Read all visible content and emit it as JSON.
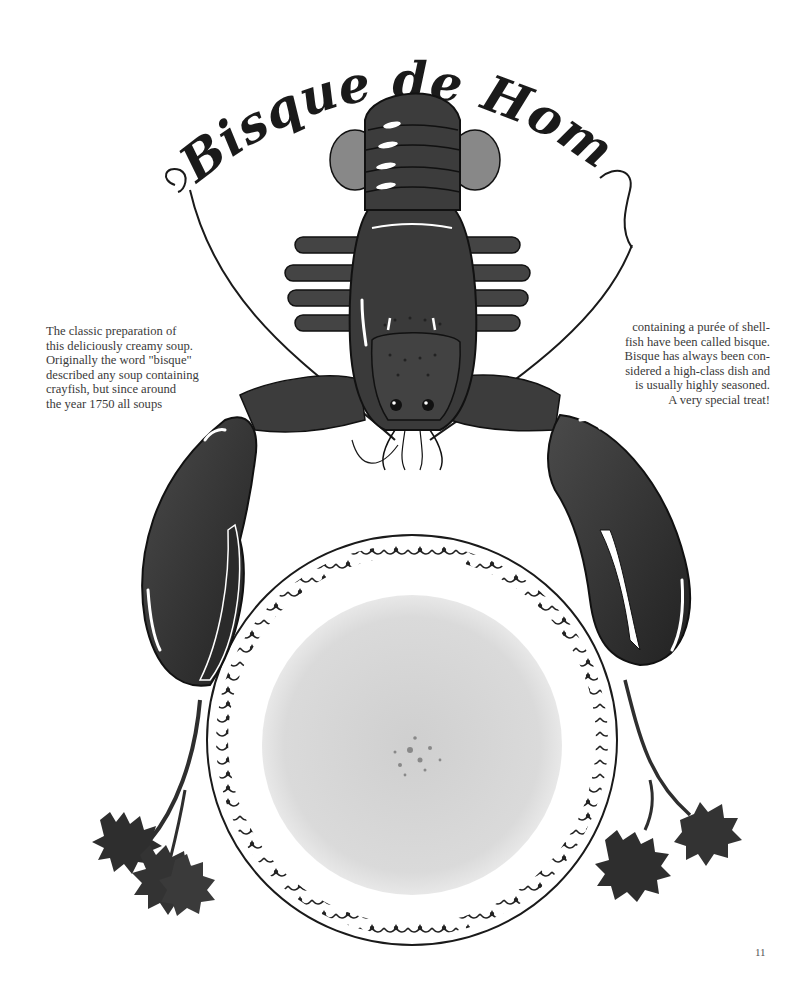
{
  "page": {
    "title": "Bisque de Homard",
    "page_number": "11"
  },
  "text": {
    "left_column": [
      "The classic preparation of",
      "this deliciously creamy soup.",
      "Originally the word \"bisque\"",
      "described any soup containing",
      "crayfish, but since around",
      "the year 1750 all soups"
    ],
    "right_column": [
      "containing a purée of shell-",
      "fish have been called bisque.",
      "Bisque has always been con-",
      "sidered a high-class dish and",
      "is usually highly seasoned.",
      "A very special treat!"
    ]
  },
  "illustration": {
    "subject": "lobster above a plate of bisque flanked by parsley sprigs",
    "colors": {
      "lobster": "#3c3c3c",
      "lobster_dark": "#262626",
      "soup": "#d6d6d6",
      "plate_rim": "#1a1a1a",
      "parsley": "#2e2e2e"
    }
  }
}
